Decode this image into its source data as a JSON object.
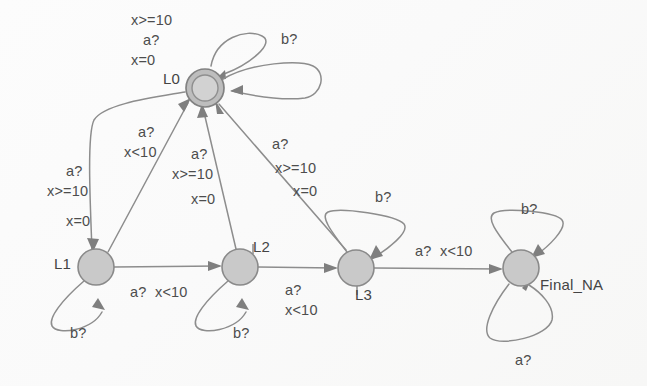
{
  "diagram": {
    "type": "state-machine",
    "colors": {
      "node_fill": "#c9c9c9",
      "node_stroke": "#8a8a8a",
      "edge": "#8d8d8d",
      "text": "#4a4a4a",
      "background": "#fdfdfd"
    },
    "states": [
      {
        "id": "L0",
        "label": "L0",
        "shape": "double-circle",
        "cx": 205,
        "cy": 88
      },
      {
        "id": "L1",
        "label": "L1",
        "shape": "circle",
        "cx": 96,
        "cy": 267
      },
      {
        "id": "L2",
        "label": "L2",
        "shape": "circle",
        "cx": 240,
        "cy": 267
      },
      {
        "id": "L3",
        "label": "L3",
        "shape": "circle",
        "cx": 356,
        "cy": 268
      },
      {
        "id": "FinalNA",
        "label": "Final_NA",
        "shape": "circle",
        "cx": 521,
        "cy": 268
      }
    ],
    "edge_labels": {
      "l0_self_top_line1": "x>=10",
      "l0_self_top_line2": "a?",
      "l0_self_top_line3": "x=0",
      "l0_self_right": "b?",
      "l1_to_l0_line1": "a?",
      "l1_to_l0_line2": "x<10",
      "l0_to_l1_line1": "a?",
      "l0_to_l1_line2": "x>=10",
      "l0_to_l1_line3": "x=0",
      "l2_to_l0_line1": "a?",
      "l2_to_l0_line2": "x>=10",
      "l2_to_l0_line3": "x=0",
      "l3_to_l0_line1": "a?",
      "l3_to_l0_line2": "x>=10",
      "l3_to_l0_line3": "x=0",
      "l1_to_l2": "a?  x<10",
      "l2_to_l3_line1": "a?",
      "l2_to_l3_line2": "x<10",
      "l3_to_final": "a?  x<10",
      "l1_self": "b?",
      "l2_self": "b?",
      "l3_self": "b?",
      "final_self_top": "b?",
      "final_self_bottom": "a?"
    }
  }
}
